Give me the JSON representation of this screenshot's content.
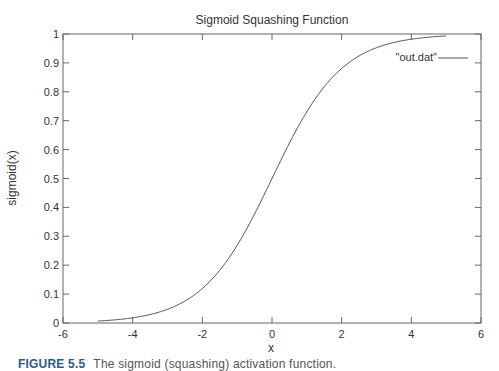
{
  "chart_data": {
    "type": "line",
    "title": "Sigmoid Squashing Function",
    "xlabel": "x",
    "ylabel": "sigmoid(x)",
    "xlim": [
      -6,
      6
    ],
    "ylim": [
      0,
      1
    ],
    "x_ticks": [
      -6,
      -4,
      -2,
      0,
      2,
      4,
      6
    ],
    "y_ticks": [
      0,
      0.1,
      0.2,
      0.3,
      0.4,
      0.5,
      0.6,
      0.7,
      0.8,
      0.9,
      1
    ],
    "grid": false,
    "legend_position": "top-right",
    "series": [
      {
        "name": "\"out.dat\"",
        "function": "1/(1+exp(-x))",
        "x": [
          -5,
          -4,
          -3,
          -2,
          -1,
          0,
          1,
          2,
          3,
          4,
          5
        ],
        "y": [
          0.007,
          0.018,
          0.047,
          0.119,
          0.269,
          0.5,
          0.731,
          0.881,
          0.953,
          0.982,
          0.993
        ],
        "color": "#555555"
      }
    ]
  },
  "caption": {
    "figure_label": "FIGURE 5.5",
    "text": "The sigmoid (squashing) activation function."
  },
  "colors": {
    "axis": "#666666",
    "curve": "#555555",
    "text": "#333333"
  }
}
